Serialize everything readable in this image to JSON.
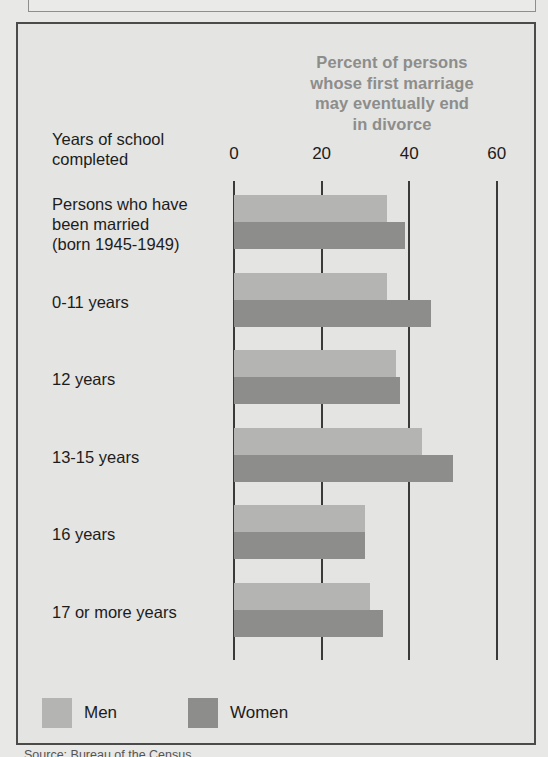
{
  "chart_data": {
    "type": "bar",
    "orientation": "horizontal",
    "title_lines": [
      "Percent of persons",
      "whose first marriage",
      "may eventually  end",
      "in divorce"
    ],
    "xlabel": "",
    "ylabel": "Years of school completed",
    "ylabel_lines": [
      "Years of school",
      "completed"
    ],
    "xlim": [
      0,
      60
    ],
    "xticks": [
      0,
      20,
      40,
      60
    ],
    "xtick_labels": [
      "0",
      "20",
      "40",
      "60"
    ],
    "grid": true,
    "legend_position": "bottom-left",
    "categories": [
      "Persons who have been married (born 1945-1949)",
      "0-11 years",
      "12 years",
      "13-15 years",
      "16 years",
      "17 or more years"
    ],
    "category_lines": [
      [
        "Persons who have",
        "been married",
        "(born 1945-1949)"
      ],
      [
        "0-11 years"
      ],
      [
        "12 years"
      ],
      [
        "13-15 years"
      ],
      [
        "16 years"
      ],
      [
        "17 or more years"
      ]
    ],
    "series": [
      {
        "name": "Men",
        "color": "#b4b4b2",
        "values": [
          35,
          35,
          37,
          43,
          30,
          31
        ]
      },
      {
        "name": "Women",
        "color": "#8d8d8b",
        "values": [
          39,
          45,
          38,
          50,
          30,
          34
        ]
      }
    ]
  },
  "legend": {
    "items": [
      {
        "label": "Men",
        "color": "#b4b4b2"
      },
      {
        "label": "Women",
        "color": "#8d8d8b"
      }
    ]
  },
  "source_note": "Source:  Bureau of the Census",
  "colors": {
    "background": "#e4e4e2",
    "frame": "#4b4b4b",
    "title_text": "#8d8d8b",
    "body_text": "#1c1c1c",
    "gridline": "#3a3a3a",
    "men_bar": "#b4b4b2",
    "women_bar": "#8d8d8b"
  }
}
